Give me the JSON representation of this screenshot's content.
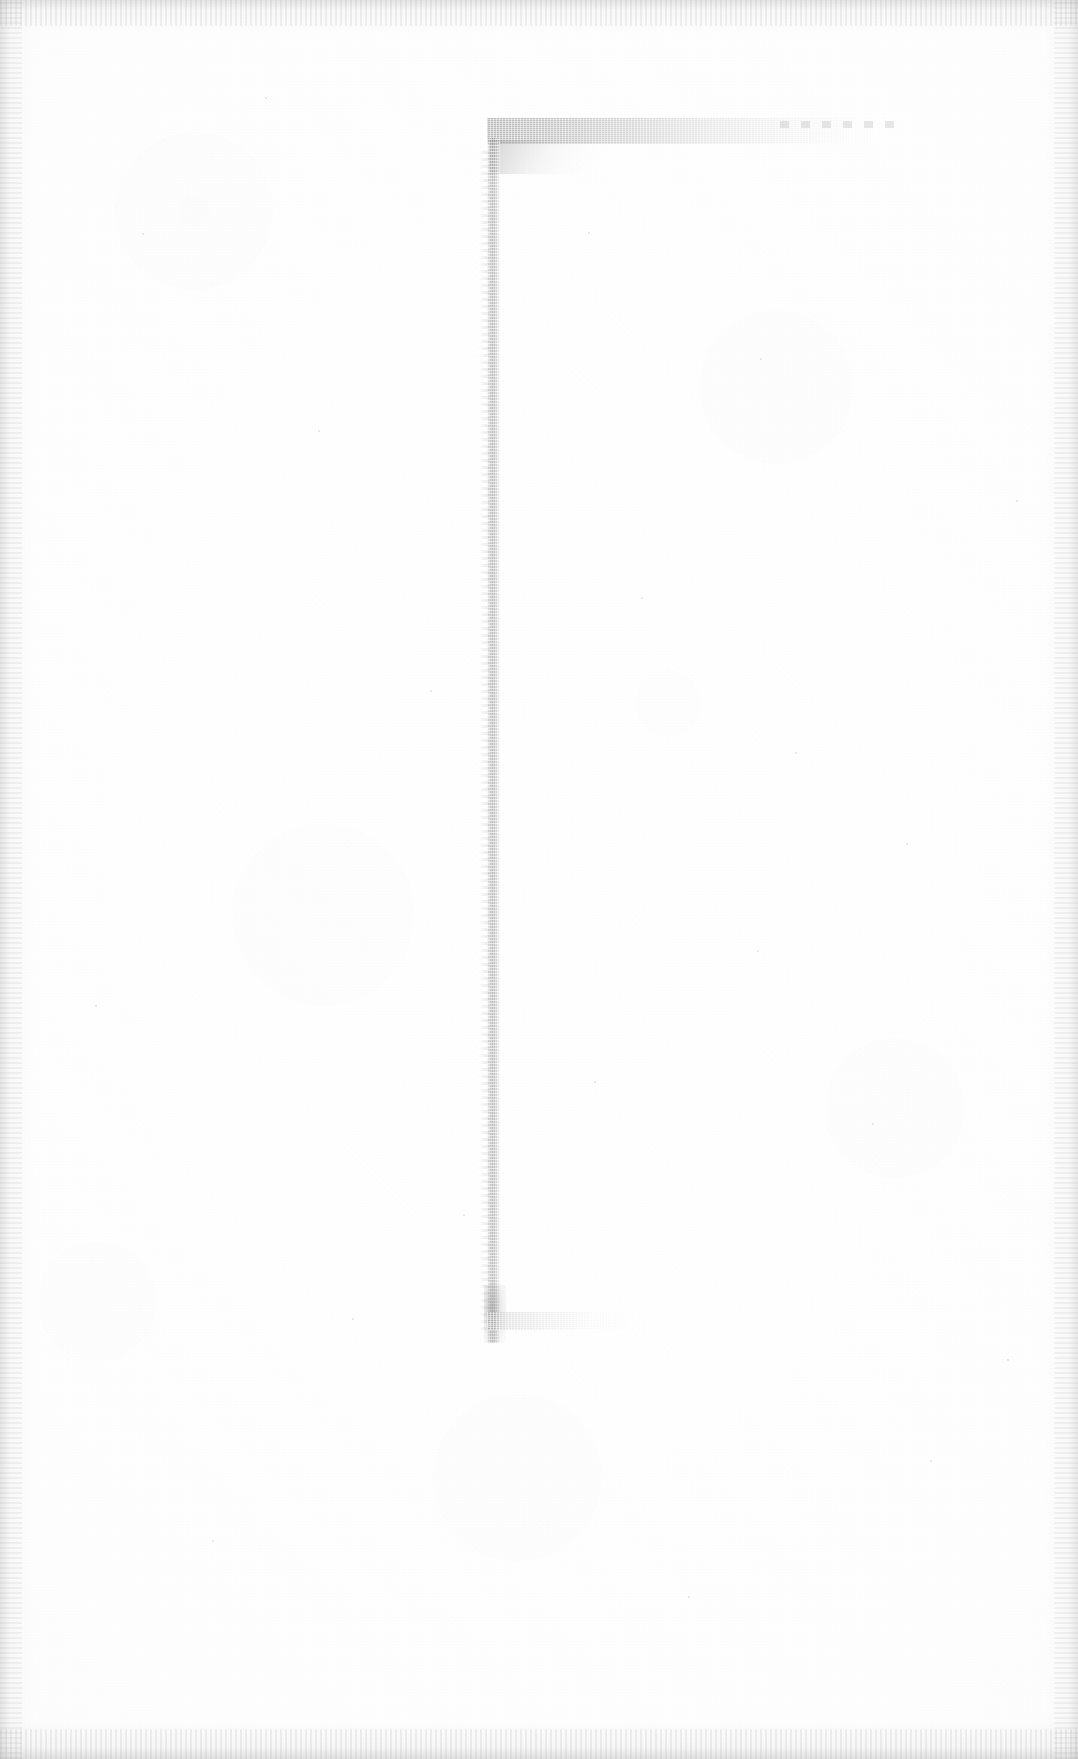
{
  "document": {
    "kind": "scanned-blank-page",
    "page_title": "Scanned blank document page",
    "description": "Nearly blank off-white scanned sheet showing only a faint grey bracket-shaped border mark near the left-centre of the page.",
    "visible_text": "",
    "text_content_present": false,
    "page_width_px": 1078,
    "page_height_px": 1759
  },
  "colors": {
    "page_background": "#ffffff",
    "paper_tint": "#fcfcfc",
    "mark_gray": "#d8d8d8",
    "mark_gray_dark": "#c9c9c9",
    "edge_vignette": "#f0f0f0",
    "speck_gray": "#bdbdbd"
  },
  "artifacts": {
    "bracket_mark": {
      "name": "bracket-border-mark",
      "shape": "open rectangle bracket, left side closed, right side open",
      "corner_top_x": 490,
      "corner_top_y": 142,
      "corner_bottom_x": 490,
      "corner_bottom_y": 1330,
      "vertical_stroke_width_px": 13,
      "top_stroke_length_px": 400,
      "top_stroke_dash_remnant_end_x": 900,
      "bottom_stroke_length_px": 150,
      "tone": "very light grey, halftone dithered"
    },
    "edge_vignette": {
      "name": "scan-edge-vignette",
      "sides": [
        "top",
        "right",
        "bottom",
        "left"
      ],
      "approx_width_px": 30
    },
    "grain": {
      "name": "paper-grain-texture",
      "type": "halftone-dither"
    }
  },
  "specks": [
    {
      "x": 142,
      "y": 233,
      "size": 2
    },
    {
      "x": 265,
      "y": 97,
      "size": 2
    },
    {
      "x": 318,
      "y": 430,
      "size": 2
    },
    {
      "x": 588,
      "y": 232,
      "size": 2
    },
    {
      "x": 760,
      "y": 358,
      "size": 2
    },
    {
      "x": 641,
      "y": 597,
      "size": 2
    },
    {
      "x": 795,
      "y": 752,
      "size": 2
    },
    {
      "x": 906,
      "y": 843,
      "size": 2
    },
    {
      "x": 757,
      "y": 950,
      "size": 2
    },
    {
      "x": 594,
      "y": 1081,
      "size": 2
    },
    {
      "x": 872,
      "y": 1123,
      "size": 2
    },
    {
      "x": 463,
      "y": 1214,
      "size": 2
    },
    {
      "x": 1007,
      "y": 1359,
      "size": 2
    },
    {
      "x": 352,
      "y": 1318,
      "size": 2
    },
    {
      "x": 930,
      "y": 1460,
      "size": 2
    },
    {
      "x": 212,
      "y": 1540,
      "size": 2
    },
    {
      "x": 688,
      "y": 1596,
      "size": 2
    },
    {
      "x": 95,
      "y": 1005,
      "size": 2
    },
    {
      "x": 430,
      "y": 690,
      "size": 2
    },
    {
      "x": 1016,
      "y": 500,
      "size": 2
    }
  ]
}
